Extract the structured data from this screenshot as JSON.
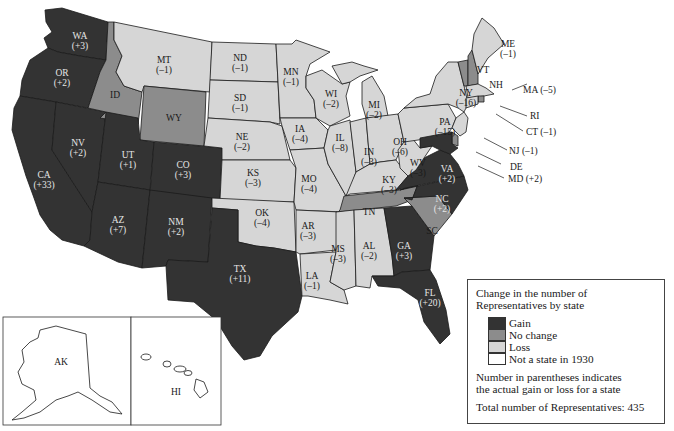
{
  "legend": {
    "title_line1": "Change in the number of",
    "title_line2": "Representatives by state",
    "items": [
      {
        "label": "Gain",
        "color": "#333333"
      },
      {
        "label": "No change",
        "color": "#8c8c8c"
      },
      {
        "label": "Loss",
        "color": "#d6d6d6"
      },
      {
        "label": "Not a state in 1930",
        "color": "#ffffff"
      }
    ],
    "note_line1": "Number in parentheses indicates",
    "note_line2": "the actual gain or loss for a state",
    "total": "Total number of Representatives: 435"
  },
  "states": {
    "WA": {
      "abbr": "WA",
      "change": "(+3)",
      "category": "gain"
    },
    "OR": {
      "abbr": "OR",
      "change": "(+2)",
      "category": "gain"
    },
    "CA": {
      "abbr": "CA",
      "change": "(+33)",
      "category": "gain"
    },
    "NV": {
      "abbr": "NV",
      "change": "(+2)",
      "category": "gain"
    },
    "ID": {
      "abbr": "ID",
      "change": "",
      "category": "no change"
    },
    "MT": {
      "abbr": "MT",
      "change": "(–1)",
      "category": "loss"
    },
    "WY": {
      "abbr": "WY",
      "change": "",
      "category": "no change"
    },
    "UT": {
      "abbr": "UT",
      "change": "(+1)",
      "category": "gain"
    },
    "CO": {
      "abbr": "CO",
      "change": "(+3)",
      "category": "gain"
    },
    "AZ": {
      "abbr": "AZ",
      "change": "(+7)",
      "category": "gain"
    },
    "NM": {
      "abbr": "NM",
      "change": "(+2)",
      "category": "gain"
    },
    "ND": {
      "abbr": "ND",
      "change": "(–1)",
      "category": "loss"
    },
    "SD": {
      "abbr": "SD",
      "change": "(–1)",
      "category": "loss"
    },
    "NE": {
      "abbr": "NE",
      "change": "(–2)",
      "category": "loss"
    },
    "KS": {
      "abbr": "KS",
      "change": "(–3)",
      "category": "loss"
    },
    "OK": {
      "abbr": "OK",
      "change": "(–4)",
      "category": "loss"
    },
    "TX": {
      "abbr": "TX",
      "change": "(+11)",
      "category": "gain"
    },
    "MN": {
      "abbr": "MN",
      "change": "(–1)",
      "category": "loss"
    },
    "IA": {
      "abbr": "IA",
      "change": "(–4)",
      "category": "loss"
    },
    "MO": {
      "abbr": "MO",
      "change": "(–4)",
      "category": "loss"
    },
    "AR": {
      "abbr": "AR",
      "change": "(–3)",
      "category": "loss"
    },
    "LA": {
      "abbr": "LA",
      "change": "(–1)",
      "category": "loss"
    },
    "WI": {
      "abbr": "WI",
      "change": "(–2)",
      "category": "loss"
    },
    "IL": {
      "abbr": "IL",
      "change": "(–8)",
      "category": "loss"
    },
    "MI": {
      "abbr": "MI",
      "change": "(–2)",
      "category": "loss"
    },
    "IN": {
      "abbr": "IN",
      "change": "(–3)",
      "category": "loss"
    },
    "OH": {
      "abbr": "OH",
      "change": "(–6)",
      "category": "loss"
    },
    "KY": {
      "abbr": "KY",
      "change": "(–3)",
      "category": "loss"
    },
    "TN": {
      "abbr": "TN",
      "change": "",
      "category": "no change"
    },
    "MS": {
      "abbr": "MS",
      "change": "(–3)",
      "category": "loss"
    },
    "AL": {
      "abbr": "AL",
      "change": "(–2)",
      "category": "loss"
    },
    "GA": {
      "abbr": "GA",
      "change": "(+3)",
      "category": "gain"
    },
    "FL": {
      "abbr": "FL",
      "change": "(+20)",
      "category": "gain"
    },
    "SC": {
      "abbr": "SC",
      "change": "",
      "category": "no change"
    },
    "NC": {
      "abbr": "NC",
      "change": "(+2)",
      "category": "gain"
    },
    "VA": {
      "abbr": "VA",
      "change": "(+2)",
      "category": "gain"
    },
    "WV": {
      "abbr": "WV",
      "change": "(–3)",
      "category": "loss"
    },
    "PA": {
      "abbr": "PA",
      "change": "(–15)",
      "category": "loss"
    },
    "NY": {
      "abbr": "NY",
      "change": "(–16)",
      "category": "loss"
    },
    "VT": {
      "abbr": "VT",
      "change": "",
      "category": "no change"
    },
    "NH": {
      "abbr": "NH",
      "change": "",
      "category": "no change"
    },
    "ME": {
      "abbr": "ME",
      "change": "(–1)",
      "category": "loss"
    },
    "MA": {
      "abbr": "MA",
      "change": "(–5)",
      "category": "loss"
    },
    "RI": {
      "abbr": "RI",
      "change": "",
      "category": "no change"
    },
    "CT": {
      "abbr": "CT",
      "change": "(–1)",
      "category": "loss"
    },
    "NJ": {
      "abbr": "NJ",
      "change": "(–1)",
      "category": "loss"
    },
    "DE": {
      "abbr": "DE",
      "change": "",
      "category": "no change"
    },
    "MD": {
      "abbr": "MD",
      "change": "(+2)",
      "category": "gain"
    },
    "AK": {
      "abbr": "AK",
      "change": "",
      "category": "not a state in 1930"
    },
    "HI": {
      "abbr": "HI",
      "change": "",
      "category": "not a state in 1930"
    }
  },
  "callouts": {
    "MA": "MA (–5)",
    "RI": "RI",
    "CT": "CT (–1)",
    "NJ": "NJ (–1)",
    "DE": "DE",
    "MD": "MD (+2)"
  }
}
